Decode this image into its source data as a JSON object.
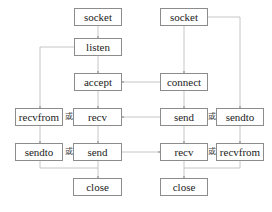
{
  "diagram": {
    "title": "",
    "colors": {
      "box_border": "#8c8c8c",
      "line": "#b0b0b0",
      "text": "#222222",
      "background": "#ffffff"
    },
    "server": {
      "socket": "socket",
      "listen": "listen",
      "accept": "accept",
      "recv": "recv",
      "send": "send",
      "close": "close",
      "recvfrom": "recvfrom",
      "sendto": "sendto"
    },
    "client": {
      "socket": "socket",
      "connect": "connect",
      "send": "send",
      "recv": "recv",
      "close": "close",
      "sendto": "sendto",
      "recvfrom": "recvfrom"
    },
    "or_label": "或",
    "edges": [
      [
        "server.socket",
        "server.listen"
      ],
      [
        "server.listen",
        "server.accept"
      ],
      [
        "server.listen",
        "server.recvfrom"
      ],
      [
        "server.accept",
        "server.recv"
      ],
      [
        "server.recv",
        "server.send"
      ],
      [
        "server.recvfrom",
        "server.sendto"
      ],
      [
        "server.send",
        "server.close"
      ],
      [
        "server.sendto",
        "server.close"
      ],
      [
        "client.socket",
        "client.connect"
      ],
      [
        "client.socket",
        "client.sendto"
      ],
      [
        "client.connect",
        "client.send"
      ],
      [
        "client.send",
        "client.recv"
      ],
      [
        "client.sendto",
        "client.recvfrom"
      ],
      [
        "client.recv",
        "client.close"
      ],
      [
        "client.recvfrom",
        "client.close"
      ],
      [
        "client.connect",
        "server.accept"
      ],
      [
        "client.send",
        "server.recv"
      ],
      [
        "server.send",
        "client.recv"
      ]
    ]
  }
}
